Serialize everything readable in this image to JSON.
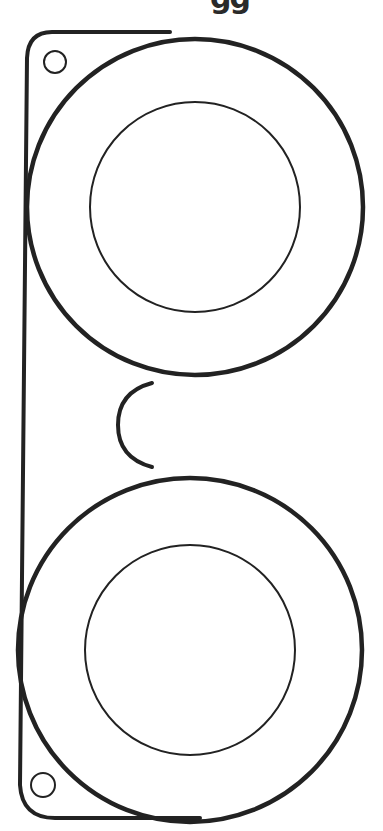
{
  "title_fragment": "gg",
  "template": {
    "subject": "glasses cutout template",
    "stroke_color": "#222222",
    "background": "#ffffff",
    "lenses": [
      {
        "name": "top-lens",
        "cx": 195,
        "cy": 207,
        "outer_r": 168,
        "inner_r": 105
      },
      {
        "name": "bottom-lens",
        "cx": 190,
        "cy": 650,
        "outer_r": 172,
        "inner_r": 105
      }
    ],
    "holes": [
      {
        "name": "top-hole",
        "cx": 55,
        "cy": 62,
        "r": 11
      },
      {
        "name": "bottom-hole",
        "cx": 43,
        "cy": 785,
        "r": 12
      }
    ]
  }
}
